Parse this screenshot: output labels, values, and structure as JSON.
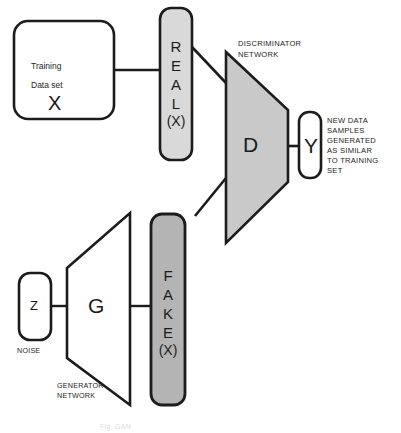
{
  "diagram": {
    "colors": {
      "stroke": "#1c1c1c",
      "fill_white": "#ffffff",
      "fill_light_gray": "#d9d9d9",
      "fill_mid_gray": "#b4b4b4",
      "fill_discriminator": "#c9c9c9",
      "text": "#1b1b1b"
    },
    "nodes": {
      "training_data": {
        "line1": "Training",
        "line2": "Data set",
        "symbol": "X"
      },
      "real_x": {
        "letters": [
          "R",
          "E",
          "A",
          "L",
          "(X)"
        ]
      },
      "fake_x": {
        "letters": [
          "F",
          "A",
          "K",
          "E",
          "(X)"
        ]
      },
      "discriminator": {
        "symbol": "D",
        "label_line1": "DISCRIMINATOR",
        "label_line2": "NETWORK"
      },
      "generator": {
        "symbol": "G",
        "label_line1": "GENERATOR",
        "label_line2": "NETWORK"
      },
      "noise": {
        "symbol": "Z",
        "label": "NOISE"
      },
      "output_y": {
        "symbol": "Y",
        "description_lines": [
          "NEW DATA",
          "SAMPLES",
          "GENERATED",
          "AS SIMILAR",
          "TO TRAINING",
          "SET"
        ]
      }
    },
    "caption": "Fig. GAN"
  }
}
